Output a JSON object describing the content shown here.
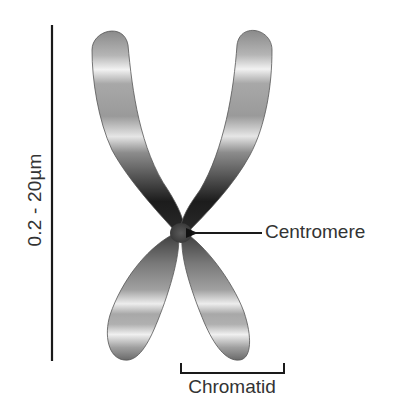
{
  "diagram": {
    "scale_bar": {
      "label": "0.2 - 20µm"
    },
    "labels": {
      "centromere": "Centromere",
      "chromatid": "Chromatid"
    },
    "colors": {
      "line": "#1a1a1a",
      "text": "#333333",
      "chromosome_dark": "#1e1e1e",
      "chromosome_mid": "#7a7a7a",
      "chromosome_light": "#e8e8e8",
      "background": "#ffffff"
    }
  }
}
